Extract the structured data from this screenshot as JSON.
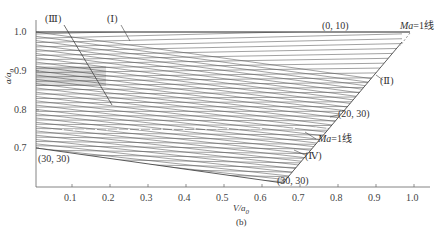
{
  "chart_data": {
    "type": "line",
    "subtype": "characteristic-mesh",
    "title": "",
    "caption": "(b)",
    "xlabel": "V/a0",
    "ylabel": "a/a0",
    "xlim": [
      0,
      1.05
    ],
    "ylim": [
      0.6,
      1.05
    ],
    "xticks": [
      "0.1",
      "0.2",
      "0.3",
      "0.4",
      "0.5",
      "0.6",
      "0.7",
      "0.8",
      "0.9",
      "1.0"
    ],
    "yticks": [
      "0.7",
      "0.8",
      "0.9",
      "1.0"
    ],
    "grid": false,
    "annotations": [
      {
        "text": "(Ⅲ)",
        "region": "III"
      },
      {
        "text": "(Ⅰ)",
        "region": "I"
      },
      {
        "text": "(0, 10)",
        "point": "top boundary"
      },
      {
        "text": "Ma=1线",
        "note": "upper sonic line"
      },
      {
        "text": "(Ⅱ)",
        "region": "II"
      },
      {
        "text": "(20, 30)",
        "point": "mesh node"
      },
      {
        "text": "Ma=1线",
        "note": "lower sonic line"
      },
      {
        "text": "(Ⅳ)",
        "region": "IV"
      },
      {
        "text": "(30, 30)",
        "point": "bottom-left mesh node"
      },
      {
        "text": "(30, 30)",
        "point": "bottom-right mesh node"
      }
    ],
    "series": [
      {
        "name": "upper boundary a/a0=1.0",
        "x": [
          0,
          0.98
        ],
        "y": [
          1.0,
          1.0
        ]
      },
      {
        "name": "mesh right boundary",
        "x": [
          0.96,
          0.65
        ],
        "y": [
          0.97,
          0.68
        ]
      },
      {
        "name": "mesh bottom boundary",
        "x": [
          0,
          0.65
        ],
        "y": [
          0.7,
          0.63
        ]
      }
    ]
  },
  "axes": {
    "x_label_main": "V/a",
    "x_label_sub": "0",
    "y_label_main": "a/a",
    "y_label_sub": "0",
    "caption": "(b)"
  },
  "labels": {
    "region_III": "(Ⅲ)",
    "region_I": "(Ⅰ)",
    "pt_0_10": "(0, 10)",
    "ma1_top_ma": "Ma",
    "ma1_top_rest": "=1线",
    "region_II": "(Ⅱ)",
    "pt_20_30": "(20, 30)",
    "ma1_low_ma": "Ma",
    "ma1_low_rest": "=1线",
    "region_IV": "(Ⅳ)",
    "pt_30_30_left": "(30, 30)",
    "pt_30_30_right": "(30, 30)"
  },
  "mesh": {
    "family_count": 34,
    "line_color": "#555555"
  }
}
